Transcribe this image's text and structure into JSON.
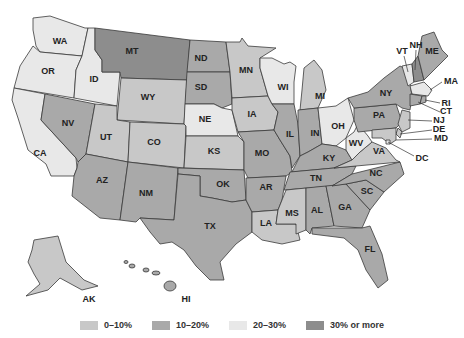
{
  "legend": {
    "items": [
      {
        "label": "0–10%",
        "color": "#c8c8c8",
        "class": "c0"
      },
      {
        "label": "10–20%",
        "color": "#a9a9a9",
        "class": "c1"
      },
      {
        "label": "20–30%",
        "color": "#e8e8e8",
        "class": "c2"
      },
      {
        "label": "30% or more",
        "color": "#8d8d8d",
        "class": "c3"
      }
    ]
  },
  "states": {
    "WA": {
      "label": "WA",
      "category": "20–30%"
    },
    "OR": {
      "label": "OR",
      "category": "20–30%"
    },
    "CA": {
      "label": "CA",
      "category": "20–30%"
    },
    "ID": {
      "label": "ID",
      "category": "20–30%"
    },
    "NV": {
      "label": "NV",
      "category": "10–20%"
    },
    "MT": {
      "label": "MT",
      "category": "30% or more"
    },
    "WY": {
      "label": "WY",
      "category": "0–10%"
    },
    "UT": {
      "label": "UT",
      "category": "0–10%"
    },
    "AZ": {
      "label": "AZ",
      "category": "10–20%"
    },
    "CO": {
      "label": "CO",
      "category": "0–10%"
    },
    "NM": {
      "label": "NM",
      "category": "10–20%"
    },
    "ND": {
      "label": "ND",
      "category": "10–20%"
    },
    "SD": {
      "label": "SD",
      "category": "10–20%"
    },
    "NE": {
      "label": "NE",
      "category": "20–30%"
    },
    "KS": {
      "label": "KS",
      "category": "0–10%"
    },
    "OK": {
      "label": "OK",
      "category": "10–20%"
    },
    "TX": {
      "label": "TX",
      "category": "10–20%"
    },
    "MN": {
      "label": "MN",
      "category": "0–10%"
    },
    "IA": {
      "label": "IA",
      "category": "0–10%"
    },
    "MO": {
      "label": "MO",
      "category": "10–20%"
    },
    "AR": {
      "label": "AR",
      "category": "10–20%"
    },
    "LA": {
      "label": "LA",
      "category": "0–10%"
    },
    "WI": {
      "label": "WI",
      "category": "20–30%"
    },
    "IL": {
      "label": "IL",
      "category": "10–20%"
    },
    "MI": {
      "label": "MI",
      "category": "0–10%"
    },
    "IN": {
      "label": "IN",
      "category": "10–20%"
    },
    "OH": {
      "label": "OH",
      "category": "20–30%"
    },
    "KY": {
      "label": "KY",
      "category": "10–20%"
    },
    "TN": {
      "label": "TN",
      "category": "10–20%"
    },
    "MS": {
      "label": "MS",
      "category": "0–10%"
    },
    "AL": {
      "label": "AL",
      "category": "10–20%"
    },
    "GA": {
      "label": "GA",
      "category": "10–20%"
    },
    "FL": {
      "label": "FL",
      "category": "10–20%"
    },
    "SC": {
      "label": "SC",
      "category": "10–20%"
    },
    "NC": {
      "label": "NC",
      "category": "10–20%"
    },
    "VA": {
      "label": "VA",
      "category": "0–10%"
    },
    "WV": {
      "label": "WV",
      "category": "20–30%"
    },
    "PA": {
      "label": "PA",
      "category": "10–20%"
    },
    "NY": {
      "label": "NY",
      "category": "10–20%"
    },
    "VT": {
      "label": "VT",
      "category": "20–30%"
    },
    "NH": {
      "label": "NH",
      "category": "30% or more"
    },
    "ME": {
      "label": "ME",
      "category": "10–20%"
    },
    "MA": {
      "label": "MA",
      "category": "20–30%"
    },
    "RI": {
      "label": "RI",
      "category": "10–20%"
    },
    "CT": {
      "label": "CT",
      "category": "10–20%"
    },
    "NJ": {
      "label": "NJ",
      "category": "0–10%"
    },
    "DE": {
      "label": "DE",
      "category": "0–10%"
    },
    "MD": {
      "label": "MD",
      "category": "0–10%"
    },
    "DC": {
      "label": "DC",
      "category": "20–30%"
    },
    "AK": {
      "label": "AK",
      "category": "0–10%"
    },
    "HI": {
      "label": "HI",
      "category": "10–20%"
    }
  }
}
